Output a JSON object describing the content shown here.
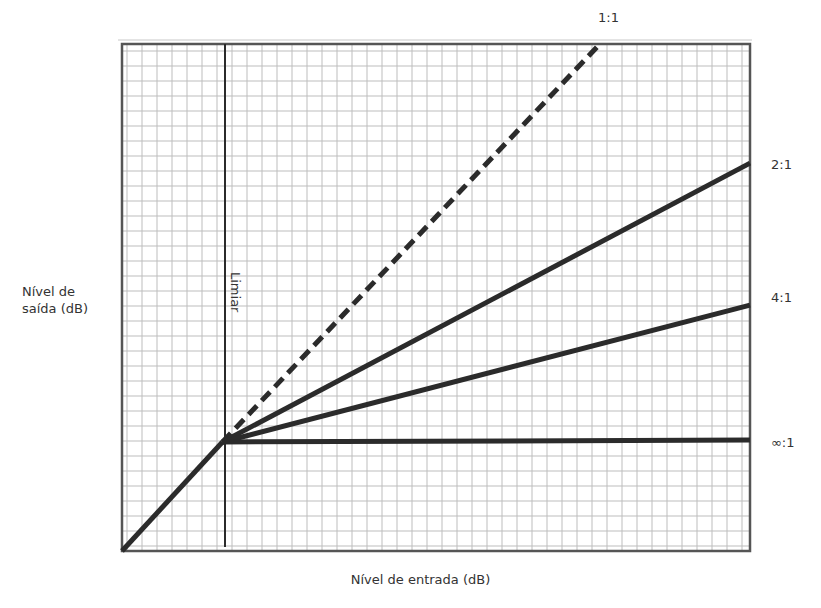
{
  "chart_data": {
    "type": "line",
    "title": "",
    "xlabel": "Nível de entrada (dB)",
    "ylabel_lines": [
      "Nível de",
      "saída (dB)"
    ],
    "ylabel": "Nível de saída (dB)",
    "grid": true,
    "axis_ticks": "none",
    "threshold": {
      "label": "Limiar",
      "x": 0.16
    },
    "x_range": [
      0,
      1
    ],
    "y_range": [
      0,
      1
    ],
    "series": [
      {
        "name": "1:1",
        "style": "dashed",
        "points": [
          [
            0,
            0
          ],
          [
            0.16,
            0.215
          ],
          [
            0.761,
            1.0
          ]
        ]
      },
      {
        "name": "2:1",
        "style": "solid",
        "points": [
          [
            0,
            0
          ],
          [
            0.16,
            0.215
          ],
          [
            1.0,
            0.765
          ]
        ]
      },
      {
        "name": "4:1",
        "style": "solid",
        "points": [
          [
            0,
            0
          ],
          [
            0.16,
            0.215
          ],
          [
            1.0,
            0.485
          ]
        ]
      },
      {
        "name": "∞:1",
        "style": "solid",
        "points": [
          [
            0,
            0
          ],
          [
            0.16,
            0.215
          ],
          [
            1.0,
            0.219
          ]
        ]
      }
    ],
    "legend": "inline labels at line ends (right side)",
    "colors": {
      "line": "#2b2b2b",
      "grid": "#bdbdbd",
      "frame": "#555555",
      "background": "#ffffff"
    }
  },
  "labels": {
    "ylabel_line1": "Nível de",
    "ylabel_line2": "saída (dB)",
    "xlabel": "Nível de entrada (dB)",
    "threshold": "Limiar",
    "ratio_1_1": "1:1",
    "ratio_2_1": "2:1",
    "ratio_4_1": "4:1",
    "ratio_inf_1": "∞:1"
  }
}
